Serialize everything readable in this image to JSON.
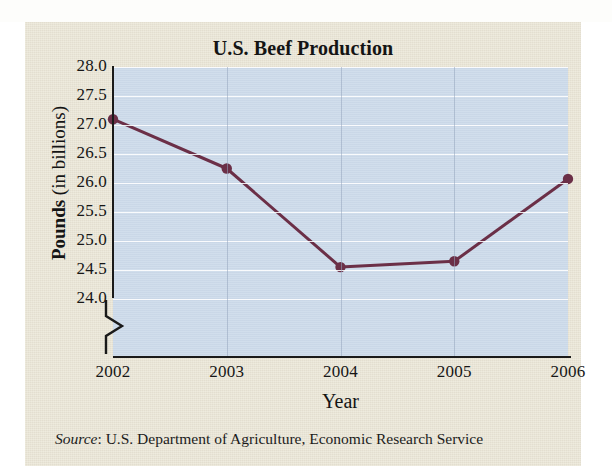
{
  "page": {
    "top_cropped_text": "g p                                                          g"
  },
  "figure": {
    "title": "U.S. Beef Production",
    "source_prefix": "Source",
    "source_text": ": U.S. Department of Agriculture, Economic Research Service",
    "y_axis_title_bold": "Pounds",
    "y_axis_title_light": " (in billions)",
    "x_axis_title": "Year",
    "panel_color": "#e9e4d4",
    "plot_color": "#ccdaea",
    "series_color": "#6b2f47",
    "gridline_color": "#ffffff"
  },
  "chart_data": {
    "type": "line",
    "title": "U.S. Beef Production",
    "xlabel": "Year",
    "ylabel": "Pounds (in billions)",
    "categories": [
      "2002",
      "2003",
      "2004",
      "2005",
      "2006"
    ],
    "x": [
      2002,
      2003,
      2004,
      2005,
      2006
    ],
    "values": [
      27.1,
      26.25,
      24.55,
      24.65,
      26.07
    ],
    "ylim": [
      24.0,
      28.0
    ],
    "yticks": [
      "28.0",
      "27.5",
      "27.0",
      "26.5",
      "26.0",
      "25.5",
      "25.0",
      "24.5",
      "24.0"
    ],
    "ytick_values": [
      28.0,
      27.5,
      27.0,
      26.5,
      26.0,
      25.5,
      25.0,
      24.5,
      24.0
    ],
    "xticks": [
      "2002",
      "2003",
      "2004",
      "2005",
      "2006"
    ],
    "grid": true,
    "legend": "none",
    "axis_break": true,
    "marker": "circle",
    "series_name": "U.S. Beef Production",
    "source": "Source: U.S. Department of Agriculture, Economic Research Service"
  }
}
